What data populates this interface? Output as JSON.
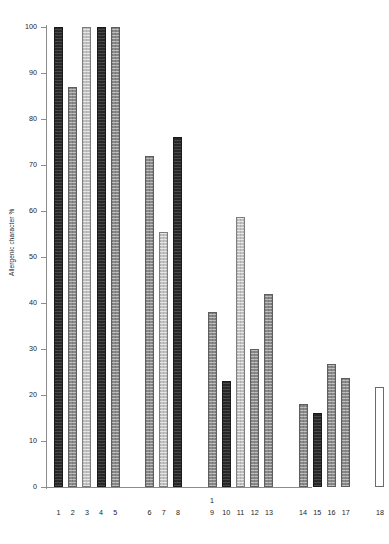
{
  "chart_data": {
    "type": "bar",
    "title": "",
    "xlabel": "",
    "ylabel": "Allergenic character %",
    "ylim": [
      0,
      100
    ],
    "yticks": [
      0,
      10,
      20,
      30,
      40,
      50,
      60,
      70,
      80,
      90,
      100
    ],
    "ytick_labels": [
      "0",
      "10",
      "20",
      "30",
      "40",
      "50",
      "60",
      "70",
      "80",
      "90",
      "100"
    ],
    "grid": false,
    "legend": "none",
    "categories": [
      "1",
      "2",
      "3",
      "4",
      "5",
      "6",
      "7",
      "8",
      "9",
      "10",
      "11",
      "12",
      "13",
      "14",
      "15",
      "16",
      "17",
      "18"
    ],
    "values": [
      100,
      87,
      100,
      100,
      100,
      72,
      55.5,
      76,
      38,
      23,
      58.7,
      30,
      42,
      18,
      16,
      26.7,
      23.8,
      21.8
    ],
    "bar_styles": [
      "dark",
      "mid",
      "light",
      "dark",
      "mid",
      "mid",
      "light",
      "dark",
      "mid",
      "dark",
      "light",
      "mid",
      "mid",
      "mid",
      "dark",
      "mid",
      "mid",
      "white"
    ],
    "groups": [
      {
        "name": "group-a",
        "categories": [
          "1",
          "2",
          "3",
          "4",
          "5"
        ]
      },
      {
        "name": "group-b",
        "categories": [
          "6",
          "7",
          "8"
        ]
      },
      {
        "name": "group-c",
        "categories": [
          "9",
          "10",
          "11",
          "12",
          "13"
        ]
      },
      {
        "name": "group-d",
        "categories": [
          "14",
          "15",
          "16",
          "17"
        ]
      },
      {
        "name": "group-e",
        "categories": [
          "18"
        ]
      }
    ],
    "annotations": [
      {
        "text": "1",
        "above_category": "9"
      }
    ]
  },
  "axis": {
    "y_title": "Allergenic character %"
  },
  "ticks": {
    "t0": "0",
    "t10": "10",
    "t20": "20",
    "t30": "30",
    "t40": "40",
    "t50": "50",
    "t60": "60",
    "t70": "70",
    "t80": "80",
    "t90": "90",
    "t100": "100"
  },
  "xlabels": {
    "b1": "1",
    "b2": "2",
    "b3": "3",
    "b4": "4",
    "b5": "5",
    "b6": "6",
    "b7": "7",
    "b8": "8",
    "b9": "9",
    "b10": "10",
    "b11": "11",
    "b12": "12",
    "b13": "13",
    "b14": "14",
    "b15": "15",
    "b16": "16",
    "b17": "17",
    "b18": "18",
    "footnote_marker": "1"
  },
  "colors": {
    "dark": "#272727",
    "mid": "#8a8a8a",
    "light": "#c2c2c2",
    "white": "#ffffff",
    "axis": "#8c8c8c",
    "text": "#1d1d1d"
  }
}
